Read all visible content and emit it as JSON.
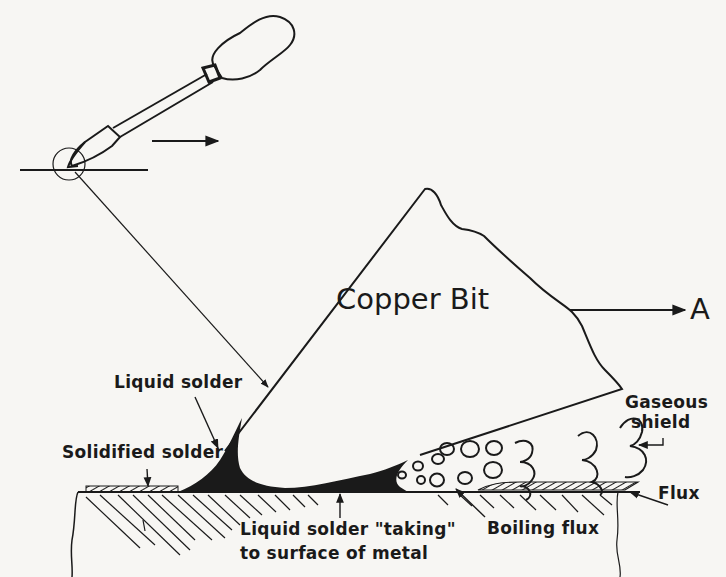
{
  "diagram": {
    "labels": {
      "copper_bit": "Copper Bit",
      "direction_arrow": "A",
      "liquid_solder": "Liquid solder",
      "solidified_solder": "Solidified solder",
      "gaseous_shield_line1": "Gaseous",
      "gaseous_shield_line2": "shield",
      "flux": "Flux",
      "boiling_flux": "Boiling flux",
      "liquid_solder_taking_line1": "Liquid solder \"taking\"",
      "liquid_solder_taking_line2": "to surface of metal"
    },
    "colors": {
      "ink": "#1a1a1a",
      "paper": "#f7f6f3"
    }
  }
}
